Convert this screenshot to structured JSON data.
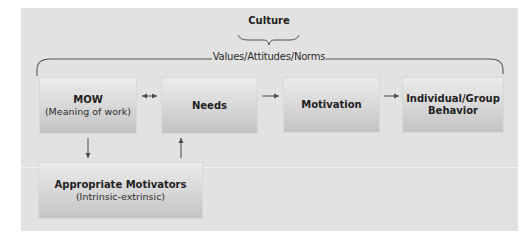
{
  "diagram": {
    "culture_label": "Culture",
    "values_label": "Values/Attitudes/Norms",
    "nodes": [
      {
        "id": "mow",
        "title": "MOW",
        "subtitle": "(Meaning of work)"
      },
      {
        "id": "needs",
        "title": "Needs",
        "subtitle": ""
      },
      {
        "id": "motivation",
        "title": "Motivation",
        "subtitle": ""
      },
      {
        "id": "behavior",
        "title": "Individual/Group Behavior",
        "subtitle": ""
      },
      {
        "id": "motivators",
        "title": "Appropriate Motivators",
        "subtitle": "(Intrinsic-extrinsic)"
      }
    ],
    "edges": [
      {
        "from": "mow",
        "to": "needs",
        "type": "bidirectional"
      },
      {
        "from": "needs",
        "to": "motivation",
        "type": "directed"
      },
      {
        "from": "motivation",
        "to": "behavior",
        "type": "directed"
      },
      {
        "from": "mow",
        "to": "motivators",
        "type": "directed"
      },
      {
        "from": "motivators",
        "to": "needs",
        "type": "directed"
      }
    ],
    "colors": {
      "background": "#e2e2e2",
      "box_top": "#ebebeb",
      "box_bottom": "#c4c4c4",
      "line": "#555555",
      "text": "#1e1e1e"
    }
  }
}
